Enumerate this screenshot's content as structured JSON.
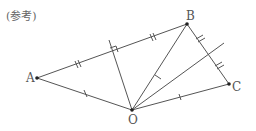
{
  "caption": "(参考)",
  "points": {
    "A": {
      "label": "A",
      "x": 37,
      "y": 78
    },
    "B": {
      "label": "B",
      "x": 187,
      "y": 24
    },
    "C": {
      "label": "C",
      "x": 229,
      "y": 84
    },
    "O": {
      "label": "O",
      "x": 132,
      "y": 110
    }
  },
  "colors": {
    "line": "#555555",
    "point": "#222222"
  }
}
